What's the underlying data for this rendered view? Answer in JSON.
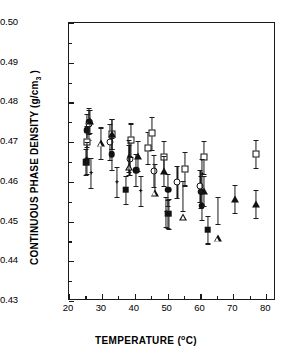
{
  "chart_data": {
    "type": "scatter",
    "title": "",
    "xlabel": "TEMPERATURE (°C)",
    "ylabel": "CONTINUOUS PHASE DENSITY (g/cm3 )",
    "ylabel_main": "CONTINUOUS PHASE DENSITY (g/cm",
    "ylabel_sub": "3",
    "ylabel_tail": " )",
    "xlabel_main": "TEMPERATURE (",
    "xlabel_deg": "o",
    "xlabel_tail": "C)",
    "xlim": [
      20,
      83
    ],
    "ylim": [
      0.43,
      0.5
    ],
    "xticks": [
      20,
      30,
      40,
      50,
      60,
      70,
      80
    ],
    "yticks": [
      "0.43",
      "0.44",
      "0.45",
      "0.46",
      "0.47",
      "0.48",
      "0.49",
      "0.50"
    ],
    "xtick_minor_step": 5,
    "ytick_minor_step": 0.005,
    "grid": false,
    "legend": "none",
    "errorbars": true,
    "marker_colors": {
      "fill": "#111111",
      "open": "#ffffff",
      "edge": "#111111"
    },
    "series": [
      {
        "name": "filled-circle",
        "marker": "fcir",
        "points": [
          {
            "x": 25.4,
            "y": 0.473,
            "err": 0.0042
          },
          {
            "x": 26.2,
            "y": 0.475,
            "err": 0.003
          },
          {
            "x": 33.0,
            "y": 0.467,
            "err": 0.004
          },
          {
            "x": 40.5,
            "y": 0.463,
            "err": 0.004
          },
          {
            "x": 50.2,
            "y": 0.458,
            "err": 0.004
          },
          {
            "x": 60.2,
            "y": 0.4575,
            "err": 0.004
          },
          {
            "x": 60.4,
            "y": 0.454,
            "err": 0.0035
          }
        ]
      },
      {
        "name": "open-circle",
        "marker": "ocir",
        "points": [
          {
            "x": 26.0,
            "y": 0.4745,
            "err": 0.004
          },
          {
            "x": 32.6,
            "y": 0.47,
            "err": 0.0045
          },
          {
            "x": 38.6,
            "y": 0.4658,
            "err": 0.004
          },
          {
            "x": 45.8,
            "y": 0.4628,
            "err": 0.004
          },
          {
            "x": 53.0,
            "y": 0.46,
            "err": 0.004
          },
          {
            "x": 60.0,
            "y": 0.459,
            "err": 0.004
          }
        ]
      },
      {
        "name": "open-square",
        "marker": "osq",
        "points": [
          {
            "x": 25.6,
            "y": 0.47,
            "err": 0.004
          },
          {
            "x": 33.0,
            "y": 0.472,
            "err": 0.0038
          },
          {
            "x": 38.8,
            "y": 0.4705,
            "err": 0.0042
          },
          {
            "x": 44.0,
            "y": 0.4685,
            "err": 0.004
          },
          {
            "x": 45.3,
            "y": 0.4722,
            "err": 0.0042
          },
          {
            "x": 48.8,
            "y": 0.4662,
            "err": 0.004
          },
          {
            "x": 55.2,
            "y": 0.4633,
            "err": 0.0042
          },
          {
            "x": 61.0,
            "y": 0.4662,
            "err": 0.0042
          },
          {
            "x": 76.8,
            "y": 0.467,
            "err": 0.0035
          }
        ]
      },
      {
        "name": "filled-square",
        "marker": "fsq",
        "points": [
          {
            "x": 25.2,
            "y": 0.465,
            "err": 0.0032
          },
          {
            "x": 37.2,
            "y": 0.458,
            "err": 0.0035
          },
          {
            "x": 50.2,
            "y": 0.452,
            "err": 0.0035
          },
          {
            "x": 62.2,
            "y": 0.448,
            "err": 0.0035
          }
        ]
      },
      {
        "name": "filled-triangle",
        "marker": "ftri",
        "points": [
          {
            "x": 26.4,
            "y": 0.4752,
            "err": 0.003
          },
          {
            "x": 33.2,
            "y": 0.472,
            "err": 0.0038
          },
          {
            "x": 41.0,
            "y": 0.4665,
            "err": 0.0038
          },
          {
            "x": 48.8,
            "y": 0.4628,
            "err": 0.0038
          },
          {
            "x": 61.2,
            "y": 0.4578,
            "err": 0.0038
          },
          {
            "x": 70.4,
            "y": 0.4557,
            "err": 0.0035
          },
          {
            "x": 76.8,
            "y": 0.4545,
            "err": 0.0035
          }
        ]
      },
      {
        "name": "open-triangle",
        "marker": "otri",
        "points": [
          {
            "x": 29.6,
            "y": 0.4697,
            "err": 0.004
          },
          {
            "x": 38.4,
            "y": 0.4655,
            "err": 0.0038
          },
          {
            "x": 46.2,
            "y": 0.4608,
            "err": 0.0038
          },
          {
            "x": 54.8,
            "y": 0.4565,
            "err": 0.0038
          },
          {
            "x": 65.2,
            "y": 0.4528,
            "err": 0.0035
          }
        ]
      },
      {
        "name": "small-star",
        "marker": "star",
        "points": [
          {
            "x": 25.4,
            "y": 0.466,
            "err": 0.004
          },
          {
            "x": 26.8,
            "y": 0.4623,
            "err": 0.0038
          },
          {
            "x": 34.6,
            "y": 0.46,
            "err": 0.0038
          },
          {
            "x": 38.2,
            "y": 0.4665,
            "err": 0.004
          },
          {
            "x": 41.8,
            "y": 0.4578,
            "err": 0.0038
          },
          {
            "x": 49.6,
            "y": 0.4525,
            "err": 0.0038
          },
          {
            "x": 50.4,
            "y": 0.452,
            "err": 0.0038
          },
          {
            "x": 60.6,
            "y": 0.462,
            "err": 0.0038
          }
        ]
      }
    ]
  }
}
